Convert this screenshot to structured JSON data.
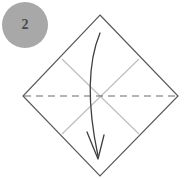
{
  "figure": {
    "type": "paper-folding-instruction",
    "canvas": {
      "width": 186,
      "height": 178,
      "background": "#ffffff"
    }
  },
  "step_badge": {
    "label": "2",
    "shape": "circle",
    "center_x": 25,
    "center_y": 25,
    "radius": 23,
    "fill": "#a8a8a8",
    "text_color": "#4a4a4a"
  },
  "paper": {
    "name": "square-sheet-rotated",
    "shape": "diamond",
    "stroke": "#5a5a5a",
    "stroke_width": 1.2,
    "fill": "#ffffff",
    "vertices": {
      "top": {
        "x": 100,
        "y": 15
      },
      "right": {
        "x": 178,
        "y": 96
      },
      "bottom": {
        "x": 100,
        "y": 176
      },
      "left": {
        "x": 23,
        "y": 96
      }
    }
  },
  "crease_lines": [
    {
      "name": "crease-diagonal-nw-se",
      "kind": "existing-crease",
      "style": "solid",
      "color": "#bdbdbd",
      "stroke_width": 1.1,
      "x1": 62,
      "y1": 59,
      "x2": 139,
      "y2": 134
    },
    {
      "name": "crease-diagonal-ne-sw",
      "kind": "existing-crease",
      "style": "solid",
      "color": "#bdbdbd",
      "stroke_width": 1.1,
      "x1": 139,
      "y1": 59,
      "x2": 62,
      "y2": 134
    }
  ],
  "fold_line": {
    "name": "horizontal-valley-fold-line",
    "kind": "fold-line",
    "style": "dashed",
    "color": "#6b6b6b",
    "stroke_width": 1.2,
    "dash": "7 5",
    "x1": 24,
    "y1": 96,
    "x2": 177,
    "y2": 96
  },
  "fold_arrow": {
    "name": "fold-direction-arrow",
    "direction": "downward",
    "color": "#3f3f3f",
    "stroke_width": 1.3,
    "path": "M 100 33 C 88 62, 87 104, 98 156",
    "arrowhead": {
      "tip_x": 98,
      "tip_y": 159,
      "left_x": 87,
      "left_y": 132,
      "right_x": 104,
      "right_y": 135
    }
  }
}
